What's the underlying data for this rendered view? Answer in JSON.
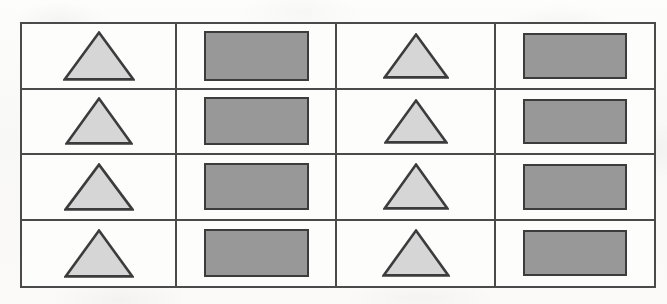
{
  "canvas": {
    "width": 667,
    "height": 304,
    "background_color": "#fbfbfa",
    "description": "Scanned worksheet page showing a 4 by 4 grid of repeated geometric shapes"
  },
  "grid": {
    "name": "shape-grid",
    "rows": 4,
    "columns": 4,
    "border_color": "#4a4a4a",
    "cell_background": "#fdfdfc",
    "column_pattern": [
      "triangle",
      "rectangle",
      "triangle",
      "rectangle"
    ],
    "column_widths": [
      155,
      160,
      159,
      158
    ],
    "outer_bounds": {
      "x": 20,
      "y": 22,
      "width": 636,
      "height": 266
    }
  },
  "shapes": {
    "triangle": {
      "label": "triangle",
      "fill_color": "#d6d6d6",
      "stroke_color": "#3c3c3c",
      "sides": 3
    },
    "rectangle": {
      "label": "rectangle",
      "fill_color": "#989898",
      "stroke_color": "#3c3c3c",
      "sides": 4
    }
  },
  "cells": [
    [
      {
        "shape": "triangle",
        "width": 72,
        "height": 50
      },
      {
        "shape": "rectangle",
        "width": 105,
        "height": 50
      },
      {
        "shape": "triangle",
        "width": 66,
        "height": 46
      },
      {
        "shape": "rectangle",
        "width": 104,
        "height": 46
      }
    ],
    [
      {
        "shape": "triangle",
        "width": 68,
        "height": 48
      },
      {
        "shape": "rectangle",
        "width": 105,
        "height": 48
      },
      {
        "shape": "triangle",
        "width": 64,
        "height": 45
      },
      {
        "shape": "rectangle",
        "width": 104,
        "height": 45
      }
    ],
    [
      {
        "shape": "triangle",
        "width": 70,
        "height": 48
      },
      {
        "shape": "rectangle",
        "width": 105,
        "height": 47
      },
      {
        "shape": "triangle",
        "width": 66,
        "height": 47
      },
      {
        "shape": "rectangle",
        "width": 104,
        "height": 46
      }
    ],
    [
      {
        "shape": "triangle",
        "width": 70,
        "height": 49
      },
      {
        "shape": "rectangle",
        "width": 105,
        "height": 48
      },
      {
        "shape": "triangle",
        "width": 68,
        "height": 48
      },
      {
        "shape": "rectangle",
        "width": 104,
        "height": 46
      }
    ]
  ]
}
